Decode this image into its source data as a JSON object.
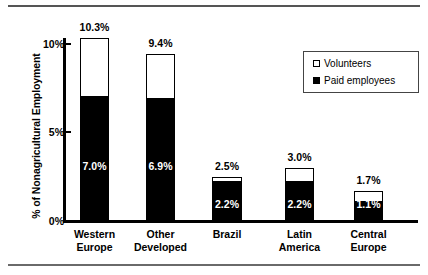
{
  "chart_data": {
    "type": "bar",
    "subtype": "stacked",
    "title": "",
    "xlabel": "",
    "ylabel": "% of Nonagricultural Employment",
    "ylim": [
      0,
      11.6
    ],
    "yticks": [
      0,
      5,
      10
    ],
    "ytick_labels": [
      "0%",
      "5%",
      "10%"
    ],
    "grid": false,
    "legend_position": "top-right",
    "categories": [
      "Western\nEurope",
      "Other\nDeveloped",
      "Brazil",
      "Latin\nAmerica",
      "Central\nEurope"
    ],
    "series": [
      {
        "name": "Paid employees",
        "color": "#000000",
        "values": [
          7.0,
          6.9,
          2.2,
          2.2,
          1.1
        ],
        "labels": [
          "7.0%",
          "6.9%",
          "2.2%",
          "2.2%",
          "1.1%"
        ]
      },
      {
        "name": "Volunteers",
        "color": "#FFFFFF",
        "values": [
          3.3,
          2.5,
          0.3,
          0.8,
          0.6
        ]
      }
    ],
    "totals": [
      10.3,
      9.4,
      2.5,
      3.0,
      1.7
    ],
    "total_labels": [
      "10.3%",
      "9.4%",
      "2.5%",
      "3.0%",
      "1.7%"
    ]
  },
  "legend": {
    "items": [
      {
        "label": "Volunteers",
        "swatch": "open-square-icon"
      },
      {
        "label": "Paid employees",
        "swatch": "filled-square-icon"
      }
    ]
  },
  "colors": {
    "paid": "#000000",
    "volunteers": "#FFFFFF",
    "axis": "#000000",
    "rule": "#555555"
  }
}
